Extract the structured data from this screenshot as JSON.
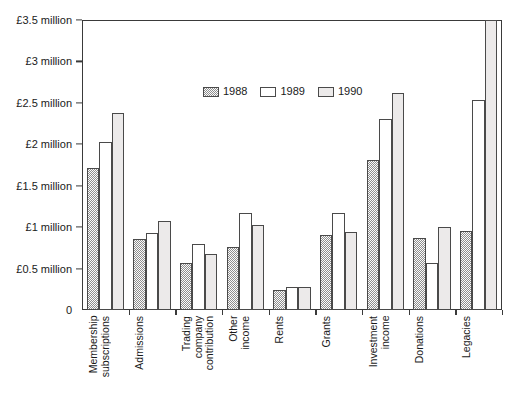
{
  "chart_data": {
    "type": "bar",
    "title": "",
    "xlabel": "",
    "ylabel": "",
    "ylim": [
      0,
      3.5
    ],
    "y_unit": "million",
    "currency": "£",
    "grid": false,
    "legend_position": "upper-center",
    "categories": [
      "Membership subscriptions",
      "Admissions",
      "Trading company contribution",
      "Other income",
      "Rents",
      "Grants",
      "Investment income",
      "Donations",
      "Legacies"
    ],
    "category_lines": [
      [
        "Membership",
        "subscriptions"
      ],
      [
        "Admissions"
      ],
      [
        "Trading",
        "company",
        "contribution"
      ],
      [
        "Other",
        "income"
      ],
      [
        "Rents"
      ],
      [
        "Grants"
      ],
      [
        "Investment",
        "income"
      ],
      [
        "Donations"
      ],
      [
        "Legacies"
      ]
    ],
    "series": [
      {
        "name": "1988",
        "fill": "stipple",
        "color": "#fbfbfb",
        "values": [
          1.71,
          0.86,
          0.57,
          0.76,
          0.24,
          0.9,
          1.81,
          0.87,
          0.95
        ]
      },
      {
        "name": "1989",
        "fill": "white",
        "color": "#ffffff",
        "values": [
          2.03,
          0.93,
          0.8,
          1.17,
          0.28,
          1.17,
          2.31,
          0.57,
          2.54
        ]
      },
      {
        "name": "1990",
        "fill": "solid-grey",
        "color": "#eceaea",
        "values": [
          2.38,
          1.07,
          0.67,
          1.02,
          0.28,
          0.94,
          2.62,
          1.0,
          3.5
        ]
      }
    ],
    "y_ticks": [
      {
        "value": 3.5,
        "label": "£3.5 million"
      },
      {
        "value": 3.0,
        "label": "£3 million"
      },
      {
        "value": 2.5,
        "label": "£2.5 million"
      },
      {
        "value": 2.0,
        "label": "£2 million"
      },
      {
        "value": 1.5,
        "label": "£1.5 million"
      },
      {
        "value": 1.0,
        "label": "£1 million"
      },
      {
        "value": 0.5,
        "label": "£0.5 million"
      },
      {
        "value": 0.0,
        "label": "0"
      }
    ],
    "legend": [
      {
        "label": "1988"
      },
      {
        "label": "1989"
      },
      {
        "label": "1990"
      }
    ]
  }
}
